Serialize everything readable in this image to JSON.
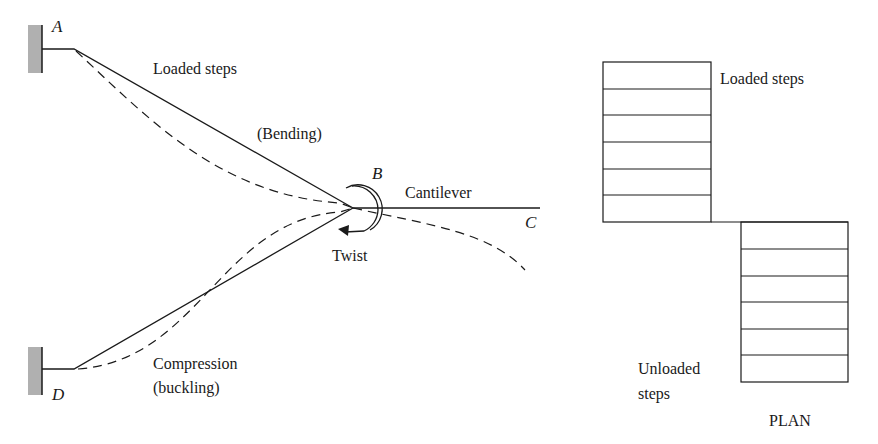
{
  "figure": {
    "elevation": {
      "nodes": {
        "A": "A",
        "B": "B",
        "C": "C",
        "D": "D"
      },
      "labels": {
        "loaded_steps": "Loaded steps",
        "bending": "(Bending)",
        "cantilever": "Cantilever",
        "twist": "Twist",
        "compression": "Compression",
        "buckling": "(buckling)"
      }
    },
    "plan": {
      "title": "PLAN",
      "loaded_label": "Loaded steps",
      "unloaded_label_line1": "Unloaded",
      "unloaded_label_line2": "steps",
      "loaded_step_count": 6,
      "unloaded_step_count": 6
    },
    "colors": {
      "line": "#1a1a1a",
      "support_hatch": "#b0b0b0",
      "background": "#ffffff"
    }
  }
}
